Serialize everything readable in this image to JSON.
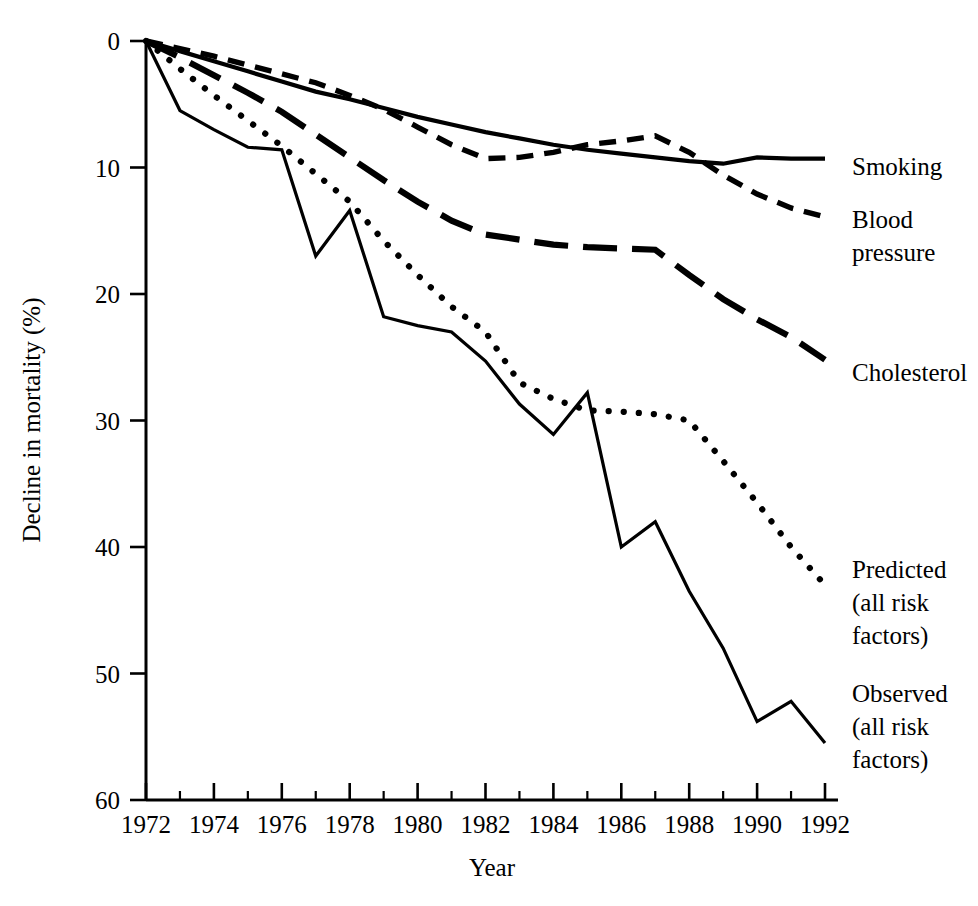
{
  "chart_data": {
    "type": "line",
    "title": "",
    "xlabel": "Year",
    "ylabel": "Decline in mortality (%)",
    "xlim": [
      1972,
      1992
    ],
    "ylim": [
      0,
      60
    ],
    "y_inverted": true,
    "grid": false,
    "legend_position": "right-inline-labels",
    "x_major_ticks": [
      1972,
      1974,
      1976,
      1978,
      1980,
      1982,
      1984,
      1986,
      1988,
      1990,
      1992
    ],
    "x_minor_ticks": [
      1973,
      1975,
      1977,
      1979,
      1981,
      1983,
      1985,
      1987,
      1989,
      1991
    ],
    "y_ticks": [
      0,
      10,
      20,
      30,
      40,
      50,
      60
    ],
    "x": [
      1972,
      1973,
      1974,
      1975,
      1976,
      1977,
      1978,
      1979,
      1980,
      1981,
      1982,
      1983,
      1984,
      1985,
      1986,
      1987,
      1988,
      1989,
      1990,
      1991,
      1992
    ],
    "series": [
      {
        "name": "Smoking",
        "style": "solid",
        "values": [
          0,
          0.8,
          1.6,
          2.4,
          3.2,
          4.0,
          4.6,
          5.3,
          6.0,
          6.6,
          7.2,
          7.7,
          8.2,
          8.6,
          8.9,
          9.2,
          9.5,
          9.7,
          9.2,
          9.3,
          9.3
        ]
      },
      {
        "name": "Blood pressure",
        "style": "short-dash",
        "values": [
          0,
          0.6,
          1.2,
          1.9,
          2.6,
          3.3,
          4.3,
          5.4,
          6.8,
          8.2,
          9.3,
          9.2,
          8.8,
          8.2,
          7.9,
          7.5,
          8.8,
          10.6,
          12.1,
          13.2,
          13.9
        ]
      },
      {
        "name": "Cholesterol",
        "style": "long-dash",
        "values": [
          0,
          1.3,
          2.7,
          4.1,
          5.6,
          7.4,
          9.2,
          11.0,
          12.7,
          14.2,
          15.3,
          15.7,
          16.1,
          16.3,
          16.4,
          16.5,
          18.5,
          20.4,
          22.0,
          23.4,
          25.2
        ]
      },
      {
        "name": "Predicted (all risk factors)",
        "style": "dotted",
        "values": [
          0,
          2.2,
          4.3,
          6.3,
          8.3,
          10.5,
          12.7,
          15.8,
          18.5,
          21.0,
          23.0,
          27.0,
          28.3,
          29.2,
          29.3,
          29.5,
          30.0,
          33.2,
          36.5,
          40.0,
          43.0
        ]
      },
      {
        "name": "Observed (all risk factors)",
        "style": "thin-solid",
        "values": [
          0,
          5.5,
          7.0,
          8.4,
          8.6,
          17.0,
          13.4,
          21.8,
          22.5,
          23.0,
          25.3,
          28.7,
          31.1,
          27.8,
          40.0,
          38.0,
          43.5,
          48.0,
          53.8,
          52.2,
          55.5
        ]
      }
    ],
    "annotations": [
      {
        "text": "Smoking",
        "lines": [
          "Smoking"
        ],
        "series": "Smoking"
      },
      {
        "text": "Blood pressure",
        "lines": [
          "Blood",
          "pressure"
        ],
        "series": "Blood pressure"
      },
      {
        "text": "Cholesterol",
        "lines": [
          "Cholesterol"
        ],
        "series": "Cholesterol"
      },
      {
        "text": "Predicted (all risk factors)",
        "lines": [
          "Predicted",
          "(all risk",
          "factors)"
        ],
        "series": "Predicted (all risk factors)"
      },
      {
        "text": "Observed (all risk factors)",
        "lines": [
          "Observed",
          "(all risk",
          "factors)"
        ],
        "series": "Observed (all risk factors)"
      }
    ]
  },
  "axes": {
    "y_title": "Decline in mortality (%)",
    "x_title": "Year",
    "y_tick_labels": [
      "0",
      "10",
      "20",
      "30",
      "40",
      "50",
      "60"
    ],
    "x_tick_labels": [
      "1972",
      "1974",
      "1976",
      "1978",
      "1980",
      "1982",
      "1984",
      "1986",
      "1988",
      "1990",
      "1992"
    ]
  },
  "labels": {
    "smoking": "Smoking",
    "blood_pressure_l1": "Blood",
    "blood_pressure_l2": "pressure",
    "cholesterol": "Cholesterol",
    "predicted_l1": "Predicted",
    "predicted_l2": "(all risk",
    "predicted_l3": "factors)",
    "observed_l1": "Observed",
    "observed_l2": "(all risk",
    "observed_l3": "factors)"
  },
  "colors": {
    "ink": "#000000",
    "background": "#ffffff"
  }
}
